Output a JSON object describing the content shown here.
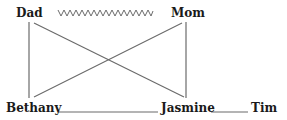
{
  "diagram": {
    "type": "family-tree",
    "nodes": {
      "dad": "Dad",
      "mom": "Mom",
      "bethany": "Bethany",
      "jasmine": "Jasmine",
      "tim": "Tim"
    },
    "relationships": [
      {
        "from": "Dad",
        "to": "Mom",
        "style": "zigzag",
        "meaning": "conflicted relationship"
      },
      {
        "from": "Dad",
        "to": "Bethany",
        "style": "solid"
      },
      {
        "from": "Dad",
        "to": "Jasmine",
        "style": "solid"
      },
      {
        "from": "Mom",
        "to": "Bethany",
        "style": "solid"
      },
      {
        "from": "Mom",
        "to": "Jasmine",
        "style": "solid"
      },
      {
        "from": "Bethany",
        "to": "Jasmine",
        "style": "solid-underline"
      },
      {
        "from": "Jasmine",
        "to": "Tim",
        "style": "solid-underline"
      }
    ],
    "colors": {
      "line": "#6b6b6b",
      "text": "#1a1a1a",
      "background": "#ffffff"
    }
  }
}
